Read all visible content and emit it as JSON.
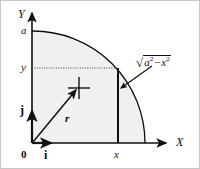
{
  "figure": {
    "background_color": "#ffffff",
    "stroke_color": "#101010",
    "fill_color": "#f0f0f0",
    "border_color": "#b4b4b4"
  },
  "axes": {
    "x_label": "X",
    "y_label": "Y",
    "origin_label": "0"
  },
  "ticks": {
    "y_top": "a",
    "y_point": "y",
    "x_point": "x"
  },
  "vectors": {
    "i_label": "i",
    "j_label": "j",
    "r_label": "r"
  },
  "annotation": {
    "radical_glyph": "√",
    "base_a": "a",
    "exponent_a": "2",
    "operator": "−",
    "base_x": "x",
    "exponent_x": "2",
    "full_text": "√(a² − x²)"
  },
  "geometry": {
    "origin": [
      32,
      143
    ],
    "radius_px": 113,
    "x_value_px": 118,
    "y_value_px": 68,
    "point_marker": [
      78,
      88
    ]
  }
}
